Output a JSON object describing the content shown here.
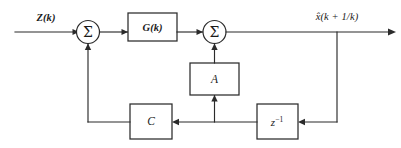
{
  "diagram": {
    "type": "signal-flow-block-diagram",
    "stroke_color": "#2b2b2b",
    "background_color": "#ffffff",
    "signals": {
      "input_label": "Z(k)",
      "output_label": "x̂(k + 1/k)"
    },
    "junctions": {
      "sum1_symbol": "Σ",
      "sum2_symbol": "Σ"
    },
    "blocks": {
      "gain_g": "G(k)",
      "gain_a": "A",
      "gain_c": "C",
      "delay_z_base": "z",
      "delay_z_exponent": "−1"
    }
  }
}
